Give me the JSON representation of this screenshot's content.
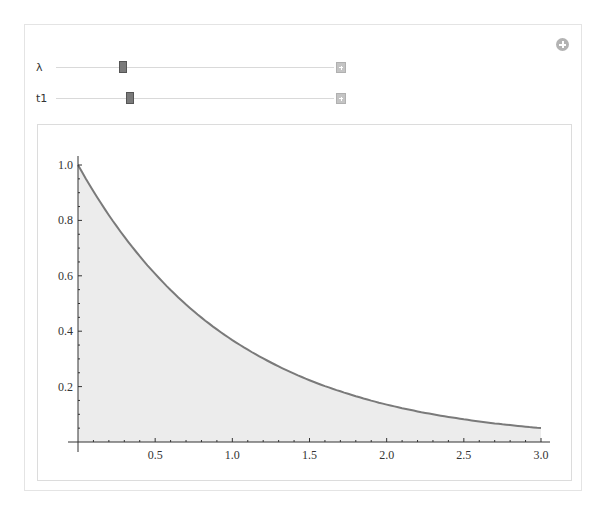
{
  "controls": {
    "add_button_icon": "plus-circle-icon",
    "sliders": [
      {
        "label": "λ",
        "position": 0.24,
        "expand_icon": "plus-square-icon"
      },
      {
        "label": "t1",
        "position": 0.265,
        "expand_icon": "plus-square-icon"
      }
    ]
  },
  "colors": {
    "curve": "#7a7a7a",
    "fill": "#ececec",
    "axis": "#333333"
  },
  "chart_data": {
    "type": "area",
    "title": "",
    "function": "exp(-x)",
    "xlabel": "",
    "ylabel": "",
    "xlim": [
      0,
      3
    ],
    "ylim": [
      0,
      1
    ],
    "x_ticks": [
      "0.5",
      "1.0",
      "1.5",
      "2.0",
      "2.5",
      "3.0"
    ],
    "y_ticks": [
      "0.2",
      "0.4",
      "0.6",
      "0.8",
      "1.0"
    ],
    "grid": false,
    "legend": null,
    "x": [
      0,
      0.25,
      0.5,
      0.75,
      1.0,
      1.25,
      1.5,
      1.75,
      2.0,
      2.25,
      2.5,
      2.75,
      3.0
    ],
    "series": [
      {
        "name": "f(x)",
        "values": [
          1.0,
          0.779,
          0.607,
          0.472,
          0.368,
          0.287,
          0.223,
          0.174,
          0.135,
          0.105,
          0.082,
          0.064,
          0.05
        ]
      }
    ]
  }
}
